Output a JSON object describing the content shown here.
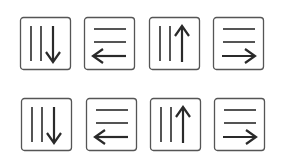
{
  "colors": {
    "background": "#ffffff",
    "stroke": "#2a2a2a",
    "box": "#555555"
  },
  "rows": [
    {
      "tiles": [
        {
          "icon": "columns-arrow-down-icon",
          "direction": "down",
          "x": 19,
          "y": 16
        },
        {
          "icon": "rows-arrow-left-icon",
          "direction": "left",
          "x": 83,
          "y": 16
        },
        {
          "icon": "columns-arrow-up-icon",
          "direction": "up",
          "x": 148,
          "y": 16
        },
        {
          "icon": "rows-arrow-right-icon",
          "direction": "right",
          "x": 212,
          "y": 16
        }
      ]
    },
    {
      "tiles": [
        {
          "icon": "columns-arrow-down-icon",
          "direction": "down",
          "x": 20,
          "y": 97
        },
        {
          "icon": "rows-arrow-left-icon",
          "direction": "left",
          "x": 85,
          "y": 97
        },
        {
          "icon": "columns-arrow-up-icon",
          "direction": "up",
          "x": 149,
          "y": 97
        },
        {
          "icon": "rows-arrow-right-icon",
          "direction": "right",
          "x": 213,
          "y": 97
        }
      ]
    }
  ]
}
